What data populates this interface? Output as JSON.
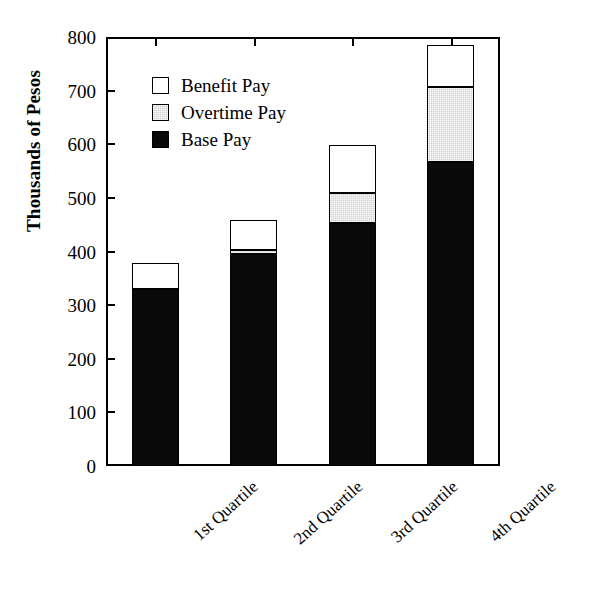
{
  "chart_data": {
    "type": "bar",
    "stacked": true,
    "title": "",
    "xlabel": "",
    "ylabel": "Thousands of Pesos",
    "categories": [
      "1st Quartile",
      "2nd Quartile",
      "3rd Quartile",
      "4th Quartile"
    ],
    "series": [
      {
        "name": "Base Pay",
        "color": "#0a0a0a",
        "values": [
          331,
          396,
          454,
          566
        ]
      },
      {
        "name": "Overtime Pay",
        "color": "#d2d2d2",
        "values": [
          0,
          6,
          56,
          140
        ]
      },
      {
        "name": "Benefit Pay",
        "color": "#ffffff",
        "values": [
          48,
          56,
          88,
          79
        ]
      }
    ],
    "totals": [
      379,
      458,
      598,
      785
    ],
    "ylim": [
      0,
      800
    ],
    "yticks": [
      0,
      100,
      200,
      300,
      400,
      500,
      600,
      700,
      800
    ],
    "ytick_labels": [
      "0",
      "100",
      "200",
      "300",
      "400",
      "500",
      "600",
      "700",
      "800"
    ],
    "grid": false,
    "legend_position": "upper-left-inside",
    "legend_order": [
      "Benefit Pay",
      "Overtime Pay",
      "Base Pay"
    ]
  },
  "legend": {
    "items": [
      {
        "label": "Benefit Pay",
        "swatch": "white-square-icon",
        "color": "#ffffff"
      },
      {
        "label": "Overtime Pay",
        "swatch": "gray-square-icon",
        "color": "#d2d2d2"
      },
      {
        "label": "Base Pay",
        "swatch": "black-square-icon",
        "color": "#0a0a0a"
      }
    ]
  },
  "axes": {
    "y_title": "Thousands of Pesos",
    "y_labels": [
      "800",
      "700",
      "600",
      "500",
      "400",
      "300",
      "200",
      "100",
      "0"
    ],
    "x_labels": [
      "1st Quartile",
      "2nd Quartile",
      "3rd Quartile",
      "4th Quartile"
    ]
  }
}
